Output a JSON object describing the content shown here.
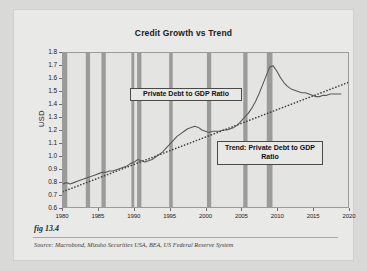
{
  "figure": {
    "caption": "fig 13.4",
    "source": "Source: Macrobond, Mizuho Securities USA, BEA, US Federal Reserve System"
  },
  "chart_data": {
    "type": "line",
    "title": "Credit Growth vs Trend",
    "xlabel": "",
    "ylabel": "USD",
    "xlim": [
      1980,
      2020
    ],
    "ylim": [
      0.6,
      1.8
    ],
    "grid": false,
    "legend_position": "none",
    "xticks": [
      "1980",
      "1985",
      "1990",
      "1995",
      "2000",
      "2005",
      "2010",
      "2015",
      "2020"
    ],
    "yticks": [
      "0.6",
      "0.7",
      "0.8",
      "0.9",
      "1.0",
      "1.1",
      "1.2",
      "1.3",
      "1.4",
      "1.5",
      "1.6",
      "1.7",
      "1.8"
    ],
    "annotations": [
      {
        "name": "series-callout",
        "text": "Private Debt to GDP Ratio"
      },
      {
        "name": "trend-callout",
        "text": "Trend: Private Debt to GDP Ratio"
      }
    ],
    "shaded_bands": {
      "name": "recession-bands",
      "color": "#9b9b99",
      "ranges": [
        [
          1980.0,
          1980.6
        ],
        [
          1983.2,
          1983.8
        ],
        [
          1985.4,
          1986.0
        ],
        [
          1989.6,
          1990.0
        ],
        [
          1990.4,
          1991.0
        ],
        [
          1994.9,
          1995.4
        ],
        [
          2000.2,
          2000.8
        ],
        [
          2005.3,
          2005.9
        ],
        [
          2008.6,
          2009.4
        ]
      ]
    },
    "series": [
      {
        "name": "Private Debt to GDP Ratio",
        "style": "solid",
        "color": "#5a5a58",
        "x": [
          1980,
          1980.5,
          1981,
          1981.5,
          1982,
          1982.5,
          1983,
          1983.5,
          1984,
          1984.5,
          1985,
          1985.5,
          1986,
          1986.5,
          1987,
          1987.5,
          1988,
          1988.5,
          1989,
          1989.5,
          1990,
          1990.5,
          1991,
          1991.5,
          1992,
          1992.5,
          1993,
          1993.5,
          1994,
          1994.5,
          1995,
          1995.5,
          1996,
          1996.5,
          1997,
          1997.5,
          1998,
          1998.5,
          1999,
          1999.5,
          2000,
          2000.5,
          2001,
          2001.5,
          2002,
          2002.5,
          2003,
          2003.5,
          2004,
          2004.5,
          2005,
          2005.5,
          2006,
          2006.5,
          2007,
          2007.5,
          2008,
          2008.5,
          2009,
          2009.5,
          2010,
          2010.5,
          2011,
          2011.5,
          2012,
          2012.5,
          2013,
          2013.5,
          2014,
          2014.5,
          2015,
          2015.5,
          2016,
          2016.5,
          2017,
          2017.5,
          2018,
          2018.5,
          2019
        ],
        "y": [
          0.78,
          0.79,
          0.78,
          0.79,
          0.8,
          0.81,
          0.82,
          0.83,
          0.84,
          0.85,
          0.86,
          0.87,
          0.87,
          0.88,
          0.88,
          0.89,
          0.9,
          0.91,
          0.92,
          0.94,
          0.95,
          0.97,
          0.96,
          0.95,
          0.96,
          0.97,
          0.99,
          1.01,
          1.03,
          1.06,
          1.09,
          1.12,
          1.15,
          1.17,
          1.19,
          1.21,
          1.22,
          1.23,
          1.22,
          1.2,
          1.19,
          1.18,
          1.19,
          1.19,
          1.19,
          1.2,
          1.2,
          1.21,
          1.22,
          1.24,
          1.27,
          1.3,
          1.33,
          1.37,
          1.42,
          1.48,
          1.55,
          1.62,
          1.69,
          1.7,
          1.66,
          1.61,
          1.57,
          1.54,
          1.52,
          1.51,
          1.5,
          1.49,
          1.49,
          1.48,
          1.47,
          1.46,
          1.46,
          1.47,
          1.47,
          1.48,
          1.48,
          1.48,
          1.48
        ]
      },
      {
        "name": "Trend: Private Debt to GDP Ratio",
        "style": "dotted",
        "color": "#3d3d3b",
        "x": [
          1980,
          2020
        ],
        "y": [
          0.72,
          1.57
        ]
      }
    ]
  }
}
